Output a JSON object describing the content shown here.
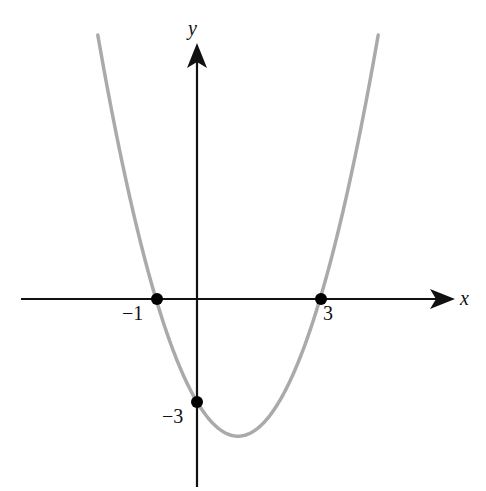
{
  "figure": {
    "type": "parabola graph",
    "equation": "y = x^2 - 2x - 3",
    "axes": {
      "x_label": "x",
      "y_label": "y"
    },
    "points": [
      {
        "name": "x-intercept-left",
        "x": -1,
        "y": 0,
        "label": "−1"
      },
      {
        "name": "x-intercept-right",
        "x": 3,
        "y": 0,
        "label": "3"
      },
      {
        "name": "y-intercept",
        "x": 0,
        "y": -3,
        "label": "−3"
      }
    ],
    "colors": {
      "curve": "#aaaaaa",
      "axes": "#111111",
      "points": "#000000"
    }
  }
}
